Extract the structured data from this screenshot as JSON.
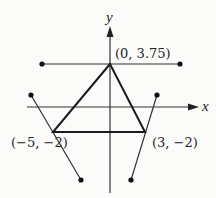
{
  "diagram": {
    "axes": {
      "x_label": "x",
      "y_label": "y"
    },
    "triangle": {
      "vertices": [
        {
          "label": "(0, 3.75)",
          "x": 0,
          "y": 3.75
        },
        {
          "label": "(−5, −2)",
          "x": -5,
          "y": -2
        },
        {
          "label": "(3, −2)",
          "x": 3,
          "y": -2
        }
      ]
    },
    "lines": [
      {
        "name": "horizontal-line-through-apex",
        "description": "horizontal segment through (0, 3.75) with dot endpoints"
      },
      {
        "name": "line-through-left-vertex",
        "description": "segment through (-5, -2) with dot endpoints"
      },
      {
        "name": "line-through-right-vertex",
        "description": "segment through (3, -2) with dot endpoints"
      }
    ],
    "colors": {
      "stroke": "#222222",
      "background": "#fbfbf9"
    }
  }
}
